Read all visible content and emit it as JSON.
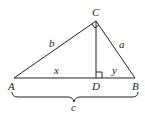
{
  "diagram": {
    "type": "right-triangle-altitude",
    "points": {
      "A": {
        "label": "A",
        "x": 14,
        "y": 78
      },
      "B": {
        "label": "B",
        "x": 135,
        "y": 78
      },
      "C": {
        "label": "C",
        "x": 96,
        "y": 21
      },
      "D": {
        "label": "D",
        "x": 96,
        "y": 78
      }
    },
    "segments": {
      "b": {
        "label": "b",
        "from": "A",
        "to": "C"
      },
      "a": {
        "label": "a",
        "from": "C",
        "to": "B"
      },
      "x": {
        "label": "x",
        "from": "A",
        "to": "D"
      },
      "y": {
        "label": "y",
        "from": "D",
        "to": "B"
      },
      "c": {
        "label": "c",
        "from": "A",
        "to": "B"
      }
    },
    "right_angles": [
      "C",
      "D"
    ],
    "colors": {
      "stroke": "#222222",
      "background": "#ffffff"
    }
  }
}
